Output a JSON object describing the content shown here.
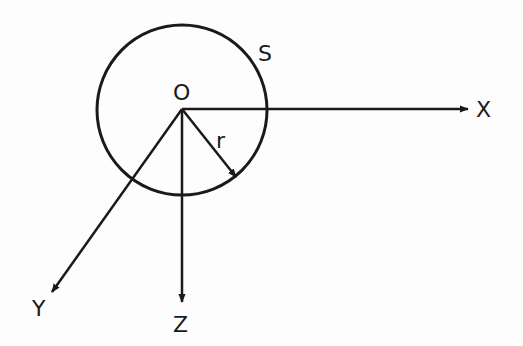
{
  "diagram": {
    "type": "coordinate-system-with-sphere",
    "labels": {
      "origin": "O",
      "sphere": "S",
      "radius": "r",
      "x_axis": "X",
      "y_axis": "Y",
      "z_axis": "Z"
    },
    "colors": {
      "ink": "#1a1a1a",
      "background": "#fdfdfd"
    }
  }
}
